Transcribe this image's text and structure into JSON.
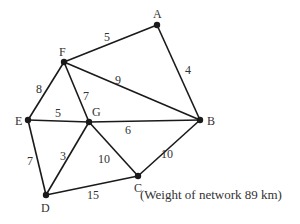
{
  "diagram": {
    "type": "weighted-network",
    "nodes": [
      {
        "id": "A",
        "x": 157,
        "y": 25,
        "lx": 153,
        "ly": 18
      },
      {
        "id": "F",
        "x": 64,
        "y": 62,
        "lx": 59,
        "ly": 56
      },
      {
        "id": "B",
        "x": 200,
        "y": 120,
        "lx": 207,
        "ly": 125
      },
      {
        "id": "E",
        "x": 28,
        "y": 120,
        "lx": 15,
        "ly": 125
      },
      {
        "id": "G",
        "x": 89,
        "y": 122,
        "lx": 92,
        "ly": 116
      },
      {
        "id": "D",
        "x": 46,
        "y": 195,
        "lx": 41,
        "ly": 212
      },
      {
        "id": "C",
        "x": 138,
        "y": 176,
        "lx": 134,
        "ly": 192
      }
    ],
    "edges": [
      {
        "from": "F",
        "to": "A",
        "weight": "5",
        "lx": 104,
        "ly": 41
      },
      {
        "from": "A",
        "to": "B",
        "weight": "4",
        "lx": 185,
        "ly": 74
      },
      {
        "from": "F",
        "to": "B",
        "weight": "9",
        "lx": 115,
        "ly": 84
      },
      {
        "from": "F",
        "to": "E",
        "weight": "8",
        "lx": 36,
        "ly": 93
      },
      {
        "from": "F",
        "to": "G",
        "weight": "7",
        "lx": 83,
        "ly": 100
      },
      {
        "from": "E",
        "to": "G",
        "weight": "5",
        "lx": 55,
        "ly": 117
      },
      {
        "from": "G",
        "to": "B",
        "weight": "6",
        "lx": 125,
        "ly": 134
      },
      {
        "from": "E",
        "to": "D",
        "weight": "7",
        "lx": 27,
        "ly": 165
      },
      {
        "from": "G",
        "to": "D",
        "weight": "3",
        "lx": 60,
        "ly": 160
      },
      {
        "from": "G",
        "to": "C",
        "weight": "10",
        "lx": 98,
        "ly": 163
      },
      {
        "from": "B",
        "to": "C",
        "weight": "10",
        "lx": 161,
        "ly": 158
      },
      {
        "from": "D",
        "to": "C",
        "weight": "15",
        "lx": 87,
        "ly": 199
      }
    ]
  },
  "caption": "(Weight of network 89 km)"
}
